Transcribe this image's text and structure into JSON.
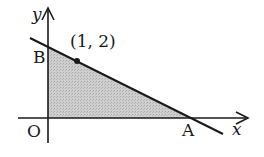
{
  "diagram": {
    "type": "coordinate-plane-shaded-region",
    "axes": {
      "x_label": "x",
      "y_label": "y",
      "origin_label": "O"
    },
    "points": {
      "A": {
        "label": "A",
        "on": "x-axis"
      },
      "B": {
        "label": "B",
        "on": "y-axis"
      },
      "P": {
        "label": "(1, 2)",
        "x": 1,
        "y": 2
      }
    },
    "line": {
      "passes_through": [
        "B",
        "(1, 2)",
        "A"
      ]
    },
    "shaded_region": {
      "vertices": [
        "O",
        "B",
        "A"
      ],
      "fill": "#c9c9c9"
    },
    "colors": {
      "stroke": "#1a1a1a",
      "shade": "#c9c9c9",
      "background": "#ffffff"
    }
  }
}
